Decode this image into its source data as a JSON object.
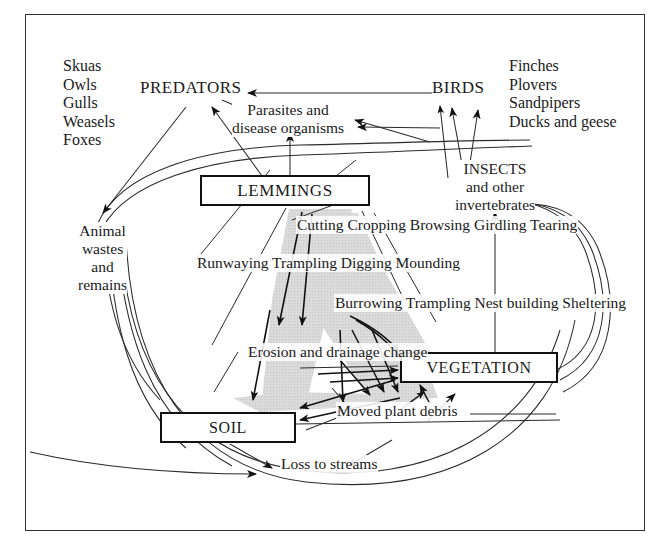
{
  "diagram": {
    "frame_color": "#333333",
    "shade_color": "#d9d9d9",
    "line_color": "#1a1a1a"
  },
  "nodes": {
    "predators": "PREDATORS",
    "birds": "BIRDS",
    "lemmings": "LEMMINGS",
    "soil": "SOIL",
    "vegetation": "VEGETATION",
    "parasites": "Parasites and\ndisease organisms",
    "insects": "INSECTS\nand other\ninvertebrates",
    "animal_wastes": "Animal\nwastes\nand\nremains",
    "erosion": "Erosion and\ndrainage\nchange",
    "moved_debris": "Moved plant debris",
    "loss_streams": "Loss to streams"
  },
  "lists": {
    "predator_examples": "Skuas\nOwls\nGulls\nWeasels\nFoxes",
    "bird_examples": "Finches\nPlovers\nSandpipers\nDucks and geese",
    "left_activities": "Runwaying\nTrampling\nDigging\nMounding",
    "center_activities": "Cutting\nCropping\nBrowsing\nGirdling\nTearing",
    "right_activities": "Burrowing\nTrampling\nNest building\nSheltering"
  }
}
